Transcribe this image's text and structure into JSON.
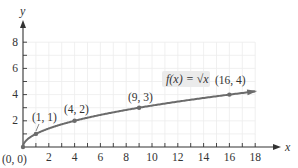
{
  "chart_data": {
    "type": "line",
    "title": "",
    "xlabel": "x",
    "ylabel": "y",
    "xlim": [
      0,
      18
    ],
    "ylim": [
      0,
      8
    ],
    "grid": true,
    "x_ticks": [
      2,
      4,
      6,
      8,
      10,
      12,
      14,
      16,
      18
    ],
    "y_ticks": [
      2,
      4,
      6,
      8
    ],
    "series": [
      {
        "name": "f(x) = √x",
        "function": "sqrt(x)",
        "x_range": [
          0,
          18
        ],
        "color": "#6b6b6b"
      }
    ],
    "points": [
      {
        "x": 0,
        "y": 0,
        "label": "(0, 0)"
      },
      {
        "x": 1,
        "y": 1,
        "label": "(1, 1)"
      },
      {
        "x": 4,
        "y": 2,
        "label": "(4, 2)"
      },
      {
        "x": 9,
        "y": 3,
        "label": "(9, 3)"
      },
      {
        "x": 16,
        "y": 4,
        "label": "(16, 4)"
      }
    ],
    "annotations": [
      {
        "text": "f(x) = √x",
        "x": 11.8,
        "y": 5.3,
        "boxed": true
      }
    ]
  },
  "labels": {
    "x_axis": "x",
    "y_axis": "y",
    "function": "f(x) = √x",
    "origin": "(0, 0)",
    "p1": "(1, 1)",
    "p2": "(4, 2)",
    "p3": "(9, 3)",
    "p4": "(16, 4)",
    "xt2": "2",
    "xt4": "4",
    "xt6": "6",
    "xt8": "8",
    "xt10": "10",
    "xt12": "12",
    "xt14": "14",
    "xt16": "16",
    "xt18": "18",
    "yt2": "2",
    "yt4": "4",
    "yt6": "6",
    "yt8": "8"
  },
  "colors": {
    "curve": "#6b6b6b",
    "axis": "#333333",
    "grid": "#ececec",
    "label_box": "#ebebeb"
  }
}
